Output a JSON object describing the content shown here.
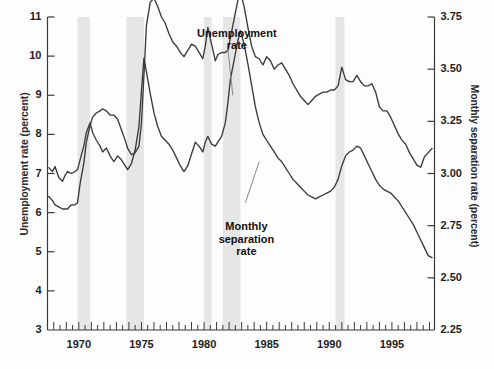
{
  "chart_data": {
    "type": "line",
    "title": "",
    "xlabel": "",
    "ylabel": "Unemployment rate (percent)",
    "y2label": "Monthly separation rate (percent)",
    "xlim": [
      1967.5,
      1998.4
    ],
    "ylim": [
      3,
      11
    ],
    "y2lim": [
      2.25,
      3.75
    ],
    "grid": false,
    "legend_position": "inline-annotations",
    "x_ticks": [
      1970,
      1975,
      1980,
      1985,
      1990,
      1995
    ],
    "x_tick_labels": [
      "1970",
      "1975",
      "1980",
      "1985",
      "1990",
      "1995"
    ],
    "x_minor_tick_interval": 0.5,
    "y_ticks": [
      3,
      4,
      5,
      6,
      7,
      8,
      9,
      10,
      11
    ],
    "y_tick_labels": [
      "3",
      "4",
      "5",
      "6",
      "7",
      "8",
      "9",
      "10",
      "11"
    ],
    "y2_ticks": [
      2.25,
      2.5,
      2.75,
      3.0,
      3.25,
      3.5,
      3.75
    ],
    "y2_tick_labels": [
      "2.25",
      "2.50",
      "2.75",
      "3.00",
      "3.25",
      "3.50",
      "3.75"
    ],
    "annotations": [
      {
        "name": "unemployment-rate-label",
        "text": "Unemployment\nrate",
        "x": 1982.6,
        "y": 10.55
      },
      {
        "name": "monthly-separation-rate-label",
        "text": "Monthly\nseparation\nrate",
        "x": 1983.4,
        "y": 5.6
      }
    ],
    "shaded_bands_label": "recession bands",
    "shaded_bands_color": "#e6e6e6",
    "shaded_bands": [
      {
        "start": 1969.9,
        "end": 1970.9
      },
      {
        "start": 1973.8,
        "end": 1975.2
      },
      {
        "start": 1980.0,
        "end": 1980.6
      },
      {
        "start": 1981.5,
        "end": 1982.9
      },
      {
        "start": 1990.5,
        "end": 1991.2
      }
    ],
    "series": [
      {
        "name": "Unemployment rate",
        "axis": "left",
        "color": "#3a3a3a",
        "x": [
          1967.6,
          1967.9,
          1968.1,
          1968.4,
          1968.7,
          1968.9,
          1969.1,
          1969.4,
          1969.7,
          1969.9,
          1970.1,
          1970.4,
          1970.6,
          1970.9,
          1971.1,
          1971.4,
          1971.7,
          1971.9,
          1972.2,
          1972.5,
          1972.8,
          1973.1,
          1973.4,
          1973.7,
          1973.9,
          1974.2,
          1974.5,
          1974.8,
          1975.0,
          1975.2,
          1975.4,
          1975.7,
          1976.0,
          1976.3,
          1976.6,
          1976.9,
          1977.2,
          1977.5,
          1977.8,
          1978.1,
          1978.4,
          1978.7,
          1979.0,
          1979.3,
          1979.6,
          1979.9,
          1980.1,
          1980.3,
          1980.6,
          1980.9,
          1981.1,
          1981.4,
          1981.7,
          1981.9,
          1982.1,
          1982.4,
          1982.7,
          1982.9,
          1983.2,
          1983.5,
          1983.8,
          1984.1,
          1984.4,
          1984.7,
          1985.0,
          1985.3,
          1985.6,
          1985.9,
          1986.2,
          1986.5,
          1986.8,
          1987.1,
          1987.4,
          1987.7,
          1988.0,
          1988.3,
          1988.6,
          1988.9,
          1989.2,
          1989.5,
          1989.8,
          1990.1,
          1990.4,
          1990.7,
          1991.0,
          1991.3,
          1991.6,
          1991.9,
          1992.2,
          1992.5,
          1992.8,
          1993.1,
          1993.4,
          1993.7,
          1994.0,
          1994.3,
          1994.6,
          1994.9,
          1995.2,
          1995.5,
          1995.8,
          1996.1,
          1996.4,
          1996.7,
          1997.0,
          1997.3,
          1997.6,
          1997.9,
          1998.2
        ],
        "y": [
          7.15,
          7.05,
          7.18,
          6.9,
          6.8,
          6.95,
          7.05,
          7.0,
          7.05,
          7.1,
          7.35,
          7.7,
          8.05,
          8.3,
          8.05,
          7.85,
          7.7,
          7.55,
          7.65,
          7.45,
          7.3,
          7.45,
          7.35,
          7.2,
          7.1,
          7.25,
          7.6,
          8.2,
          9.1,
          9.95,
          9.6,
          9.05,
          8.55,
          8.2,
          7.95,
          7.85,
          7.75,
          7.6,
          7.4,
          7.2,
          7.05,
          7.2,
          7.5,
          7.8,
          7.7,
          7.55,
          7.8,
          7.95,
          7.75,
          7.7,
          7.8,
          7.95,
          8.3,
          8.8,
          9.4,
          9.9,
          10.4,
          10.65,
          10.3,
          9.8,
          9.25,
          8.7,
          8.3,
          8.0,
          7.85,
          7.7,
          7.55,
          7.4,
          7.3,
          7.15,
          7.0,
          6.85,
          6.75,
          6.65,
          6.55,
          6.45,
          6.4,
          6.35,
          6.4,
          6.45,
          6.5,
          6.55,
          6.65,
          6.85,
          7.2,
          7.45,
          7.55,
          7.6,
          7.7,
          7.65,
          7.45,
          7.25,
          7.05,
          6.85,
          6.7,
          6.6,
          6.55,
          6.5,
          6.4,
          6.3,
          6.15,
          6.0,
          5.85,
          5.7,
          5.5,
          5.3,
          5.1,
          4.9,
          4.85
        ]
      },
      {
        "name": "Monthly separation rate",
        "axis": "right",
        "color": "#3a3a3a",
        "x": [
          1967.6,
          1967.9,
          1968.1,
          1968.4,
          1968.7,
          1968.9,
          1969.1,
          1969.4,
          1969.7,
          1969.9,
          1970.1,
          1970.4,
          1970.6,
          1970.9,
          1971.1,
          1971.4,
          1971.7,
          1971.9,
          1972.2,
          1972.5,
          1972.8,
          1973.1,
          1973.4,
          1973.7,
          1973.9,
          1974.2,
          1974.5,
          1974.8,
          1975.0,
          1975.2,
          1975.4,
          1975.7,
          1976.0,
          1976.3,
          1976.6,
          1976.9,
          1977.2,
          1977.5,
          1977.8,
          1978.1,
          1978.4,
          1978.7,
          1979.0,
          1979.3,
          1979.6,
          1979.9,
          1980.1,
          1980.3,
          1980.6,
          1980.9,
          1981.1,
          1981.4,
          1981.7,
          1981.9,
          1982.1,
          1982.4,
          1982.7,
          1982.9,
          1983.2,
          1983.5,
          1983.8,
          1984.1,
          1984.4,
          1984.7,
          1985.0,
          1985.3,
          1985.6,
          1985.9,
          1986.2,
          1986.5,
          1986.8,
          1987.1,
          1987.4,
          1987.7,
          1988.0,
          1988.3,
          1988.6,
          1988.9,
          1989.2,
          1989.5,
          1989.8,
          1990.1,
          1990.4,
          1990.7,
          1991.0,
          1991.3,
          1991.6,
          1991.9,
          1992.2,
          1992.5,
          1992.8,
          1993.1,
          1993.4,
          1993.7,
          1994.0,
          1994.3,
          1994.6,
          1994.9,
          1995.2,
          1995.5,
          1995.8,
          1996.1,
          1996.4,
          1996.7,
          1997.0,
          1997.3,
          1997.6,
          1997.9,
          1998.2
        ],
        "y_left_scale": [
          3.75,
          3.62,
          3.55,
          3.48,
          3.44,
          3.42,
          3.45,
          3.52,
          3.55,
          3.6,
          4.05,
          4.6,
          5.15,
          5.55,
          5.8,
          5.9,
          5.95,
          6.0,
          5.95,
          5.85,
          5.8,
          5.7,
          5.45,
          5.2,
          4.95,
          4.8,
          4.85,
          5.0,
          5.6,
          6.8,
          8.1,
          8.7,
          8.8,
          8.6,
          8.35,
          8.15,
          7.9,
          7.7,
          7.55,
          7.4,
          7.3,
          7.45,
          7.6,
          7.55,
          7.4,
          7.25,
          7.55,
          8.05,
          7.65,
          7.2,
          7.35,
          7.45,
          7.45,
          7.5,
          7.8,
          8.3,
          8.75,
          9.0,
          8.6,
          8.1,
          7.6,
          7.3,
          7.25,
          7.1,
          7.3,
          7.2,
          7.0,
          7.1,
          7.15,
          7.0,
          6.85,
          6.65,
          6.45,
          6.3,
          6.2,
          6.1,
          6.2,
          6.3,
          6.35,
          6.4,
          6.4,
          6.45,
          6.45,
          6.55,
          7.05,
          6.75,
          6.65,
          6.7,
          6.85,
          6.7,
          6.55,
          6.55,
          6.65,
          6.4,
          6.05,
          5.95,
          5.9,
          5.75,
          5.55,
          5.35,
          5.15,
          5.05,
          4.85,
          4.7,
          4.55,
          4.5,
          4.75,
          4.9,
          5.0
        ],
        "y": [
          2.89,
          2.87,
          2.85,
          2.84,
          2.83,
          2.83,
          2.83,
          2.85,
          2.85,
          2.86,
          2.95,
          3.05,
          3.15,
          3.23,
          3.27,
          3.29,
          3.3,
          3.31,
          3.3,
          3.28,
          3.28,
          3.26,
          3.21,
          3.16,
          3.12,
          3.09,
          3.1,
          3.13,
          3.24,
          3.47,
          3.71,
          3.82,
          3.84,
          3.8,
          3.75,
          3.72,
          3.67,
          3.63,
          3.61,
          3.58,
          3.56,
          3.59,
          3.62,
          3.61,
          3.58,
          3.55,
          3.61,
          3.7,
          3.62,
          3.54,
          3.57,
          3.58,
          3.58,
          3.59,
          3.65,
          3.74,
          3.83,
          3.87,
          3.8,
          3.7,
          3.61,
          3.56,
          3.55,
          3.52,
          3.56,
          3.54,
          3.5,
          3.52,
          3.53,
          3.5,
          3.47,
          3.43,
          3.4,
          3.37,
          3.35,
          3.33,
          3.35,
          3.37,
          3.38,
          3.39,
          3.39,
          3.4,
          3.4,
          3.42,
          3.51,
          3.45,
          3.44,
          3.44,
          3.47,
          3.44,
          3.42,
          3.42,
          3.43,
          3.39,
          3.32,
          3.3,
          3.3,
          3.27,
          3.23,
          3.19,
          3.16,
          3.14,
          3.1,
          3.07,
          3.04,
          3.03,
          3.08,
          3.1,
          3.12
        ]
      }
    ]
  }
}
